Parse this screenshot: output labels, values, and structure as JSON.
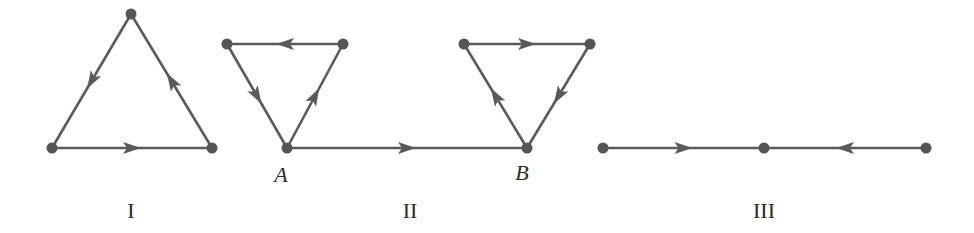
{
  "colors": {
    "stroke": "#5a5a5a",
    "node": "#555555",
    "text": "#2a2a2a"
  },
  "graphs": [
    {
      "id": "I",
      "label": "I",
      "label_pos": [
        131,
        218
      ],
      "nodes": [
        {
          "id": "top",
          "x": 131,
          "y": 14
        },
        {
          "id": "bottom-left",
          "x": 52,
          "y": 148
        },
        {
          "id": "bottom-right",
          "x": 212,
          "y": 148
        }
      ],
      "edges": [
        {
          "from": "top",
          "to": "bottom-left"
        },
        {
          "from": "bottom-left",
          "to": "bottom-right"
        },
        {
          "from": "bottom-right",
          "to": "top"
        }
      ]
    },
    {
      "id": "II",
      "label": "II",
      "label_pos": [
        410,
        218
      ],
      "nodes": [
        {
          "id": "L-tl",
          "x": 227,
          "y": 44
        },
        {
          "id": "L-tr",
          "x": 343,
          "y": 44
        },
        {
          "id": "A",
          "x": 287,
          "y": 148,
          "name": "A",
          "name_pos": [
            281,
            182
          ]
        },
        {
          "id": "R-tl",
          "x": 464,
          "y": 44
        },
        {
          "id": "R-tr",
          "x": 590,
          "y": 44
        },
        {
          "id": "B",
          "x": 527,
          "y": 148,
          "name": "B",
          "name_pos": [
            522,
            180
          ]
        }
      ],
      "edges": [
        {
          "from": "L-tr",
          "to": "L-tl"
        },
        {
          "from": "L-tl",
          "to": "A"
        },
        {
          "from": "A",
          "to": "L-tr"
        },
        {
          "from": "A",
          "to": "B"
        },
        {
          "from": "R-tl",
          "to": "R-tr"
        },
        {
          "from": "R-tr",
          "to": "B"
        },
        {
          "from": "B",
          "to": "R-tl"
        }
      ]
    },
    {
      "id": "III",
      "label": "III",
      "label_pos": [
        764,
        218
      ],
      "nodes": [
        {
          "id": "left",
          "x": 603,
          "y": 148
        },
        {
          "id": "mid",
          "x": 764,
          "y": 148
        },
        {
          "id": "right",
          "x": 926,
          "y": 148
        }
      ],
      "edges": [
        {
          "from": "left",
          "to": "mid"
        },
        {
          "from": "right",
          "to": "mid"
        }
      ]
    }
  ]
}
